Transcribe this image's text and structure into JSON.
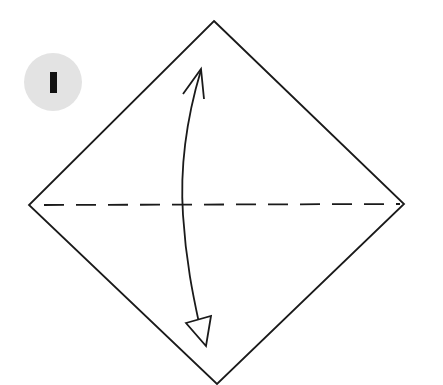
{
  "step": {
    "number": "1",
    "badge_color": "#e3e3e3",
    "number_color": "#111111"
  },
  "diagram": {
    "paper": {
      "shape": "square-rotated-45",
      "vertices": {
        "top": [
          214,
          21
        ],
        "right": [
          404,
          204
        ],
        "bottom": [
          217,
          384
        ],
        "left": [
          29,
          205
        ]
      },
      "stroke": "#1a1a1a"
    },
    "fold_line": {
      "type": "valley-fold-dashed",
      "from": [
        44,
        205
      ],
      "to": [
        400,
        204
      ]
    },
    "arrows": [
      {
        "name": "fold-up-arrow",
        "head": "open",
        "tip": [
          201,
          69
        ]
      },
      {
        "name": "unfold-down-arrow",
        "head": "hollow-triangle",
        "tip": [
          206,
          346
        ]
      }
    ],
    "action": "fold in half and unfold"
  }
}
